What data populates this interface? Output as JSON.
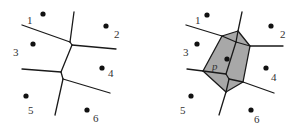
{
  "colors": {
    "edge": "#1a1a1a",
    "site": "#111111",
    "label": "#333333",
    "inserted_cell_fill": "#a8a8a8",
    "background": "#ffffff"
  },
  "left_diagram": {
    "description": "Voronoi diagram of sites 1-6",
    "sites": [
      {
        "id": "1",
        "label": "1",
        "x": 43,
        "y": 14,
        "lx": 27,
        "ly": 24
      },
      {
        "id": "2",
        "label": "2",
        "x": 106,
        "y": 26,
        "lx": 114,
        "ly": 38
      },
      {
        "id": "3",
        "label": "3",
        "x": 33,
        "y": 44,
        "lx": 13,
        "ly": 56
      },
      {
        "id": "4",
        "label": "4",
        "x": 102,
        "y": 68,
        "lx": 108,
        "ly": 77
      },
      {
        "id": "5",
        "label": "5",
        "x": 26,
        "y": 96,
        "lx": 28,
        "ly": 114
      },
      {
        "id": "6",
        "label": "6",
        "x": 87,
        "y": 110,
        "lx": 93,
        "ly": 122
      }
    ]
  },
  "right_diagram": {
    "description": "Voronoi diagram after inserting site p, new cell shaded",
    "sites": [
      {
        "id": "1",
        "label": "1",
        "x": 207,
        "y": 15,
        "lx": 195,
        "ly": 24
      },
      {
        "id": "2",
        "label": "2",
        "x": 271,
        "y": 26,
        "lx": 280,
        "ly": 38
      },
      {
        "id": "3",
        "label": "3",
        "x": 197,
        "y": 44,
        "lx": 183,
        "ly": 56
      },
      {
        "id": "p",
        "label": "p",
        "x": 227,
        "y": 59,
        "lx": 212,
        "ly": 70
      },
      {
        "id": "4",
        "label": "4",
        "x": 266,
        "y": 68,
        "lx": 271,
        "ly": 81
      },
      {
        "id": "5",
        "label": "5",
        "x": 191,
        "y": 96,
        "lx": 180,
        "ly": 114
      },
      {
        "id": "6",
        "label": "6",
        "x": 251,
        "y": 110,
        "lx": 254,
        "ly": 123
      }
    ],
    "new_cell_label": "p"
  }
}
